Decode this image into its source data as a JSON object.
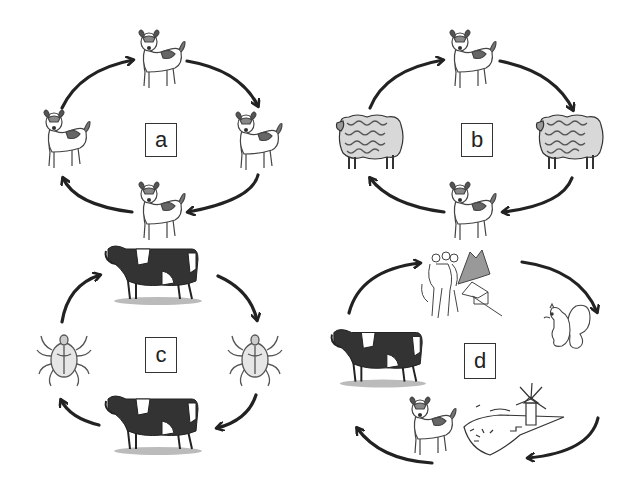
{
  "panels": [
    {
      "id": "a",
      "label": "a",
      "cycle": [
        "dog",
        "dog",
        "dog",
        "dog"
      ]
    },
    {
      "id": "b",
      "label": "b",
      "cycle": [
        "dog",
        "sheep",
        "dog",
        "sheep"
      ]
    },
    {
      "id": "c",
      "label": "c",
      "cycle": [
        "cow",
        "tick",
        "cow",
        "tick"
      ]
    },
    {
      "id": "d",
      "label": "d",
      "cycle": [
        "hikers-mountains",
        "squirrel",
        "windmill-island",
        "dog",
        "cow"
      ]
    }
  ],
  "colors": {
    "ink": "#2a2a2a",
    "arrow": "#222222",
    "background": "#ffffff"
  },
  "arrow_direction": "clockwise"
}
